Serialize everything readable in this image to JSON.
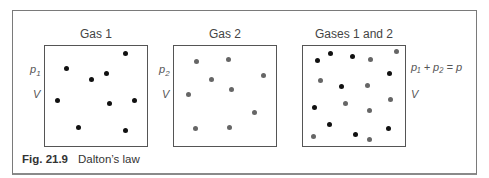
{
  "figure": {
    "caption_label": "Fig. 21.9",
    "caption_text": "Dalton’s law"
  },
  "panels": [
    {
      "title": "Gas 1",
      "pressure_label": "p",
      "pressure_sub": "1",
      "volume_label": "V",
      "dot_color": "#111111",
      "dots": [
        [
          125,
          53
        ],
        [
          66,
          68
        ],
        [
          106,
          73
        ],
        [
          91,
          79
        ],
        [
          57,
          100
        ],
        [
          109,
          103
        ],
        [
          134,
          100
        ],
        [
          78,
          127
        ],
        [
          125,
          130
        ]
      ]
    },
    {
      "title": "Gas 2",
      "pressure_label": "p",
      "pressure_sub": "2",
      "volume_label": "V",
      "dot_color": "#666666",
      "dots": [
        [
          196,
          61
        ],
        [
          228,
          59
        ],
        [
          211,
          79
        ],
        [
          263,
          75
        ],
        [
          231,
          89
        ],
        [
          188,
          94
        ],
        [
          254,
          112
        ],
        [
          195,
          128
        ],
        [
          229,
          127
        ]
      ]
    },
    {
      "title": "Gases 1 and 2",
      "equation": "p₁ + p₂ = p",
      "volume_label": "V",
      "dots_gas1": [
        [
          317,
          60
        ],
        [
          330,
          53
        ],
        [
          352,
          56
        ],
        [
          389,
          73
        ],
        [
          341,
          86
        ],
        [
          314,
          107
        ],
        [
          329,
          124
        ],
        [
          355,
          134
        ],
        [
          388,
          128
        ]
      ],
      "dots_gas2": [
        [
          396,
          51
        ],
        [
          370,
          59
        ],
        [
          320,
          80
        ],
        [
          367,
          85
        ],
        [
          345,
          103
        ],
        [
          369,
          110
        ],
        [
          390,
          99
        ],
        [
          313,
          136
        ],
        [
          369,
          139
        ]
      ]
    }
  ],
  "colors": {
    "gas1": "#111111",
    "gas2": "#666666",
    "frame": "#7a7a7a"
  }
}
